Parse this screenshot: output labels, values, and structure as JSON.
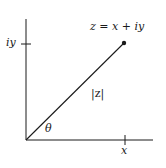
{
  "diagram": {
    "type": "complex-plane",
    "colors": {
      "line": "#1a1a1a",
      "background": "#ffffff"
    },
    "origin": {
      "x": 26,
      "y": 140
    },
    "axes": {
      "vertical": {
        "x": 26,
        "y_top": 19,
        "y_bottom": 140
      },
      "horizontal": {
        "y": 140,
        "x_left": 26,
        "x_right": 153
      }
    },
    "ticks": {
      "y_tick": {
        "y": 44,
        "x1": 21,
        "x2": 31
      },
      "x_tick": {
        "x": 125,
        "y1": 135,
        "y2": 145
      }
    },
    "vector": {
      "from": {
        "x": 26,
        "y": 140
      },
      "to": {
        "x": 124,
        "y": 43
      },
      "endpoint_radius": 2.2
    },
    "labels": {
      "point": "z = x + iy",
      "modulus": "|z|",
      "angle": "θ",
      "x_axis_tick": "x",
      "y_axis_tick": "iy"
    }
  }
}
